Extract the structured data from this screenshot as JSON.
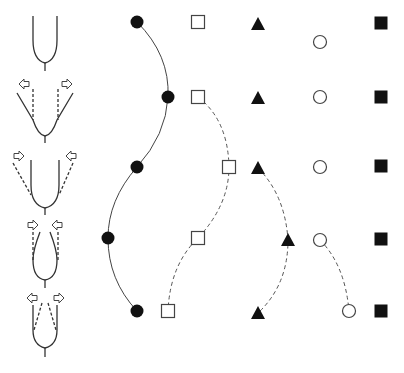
{
  "diagram": {
    "colors": {
      "stroke": "#333333",
      "fill_dark": "#111111",
      "background": "#ffffff"
    },
    "stages": [
      {
        "index": 1,
        "shape": "u-curve",
        "arrows": "none"
      },
      {
        "index": 2,
        "shape": "u-curve-widening",
        "arrows": "outward"
      },
      {
        "index": 3,
        "shape": "u-curve-narrowing",
        "arrows": "inward"
      },
      {
        "index": 4,
        "shape": "teardrop-pinched",
        "arrows": "inward"
      },
      {
        "index": 5,
        "shape": "teardrop-opening",
        "arrows": "outward"
      }
    ],
    "marker_series": [
      {
        "name": "filled-circle",
        "trajectory": "solid",
        "points": [
          [
            137,
            22
          ],
          [
            168,
            97
          ],
          [
            137,
            167
          ],
          [
            108,
            238
          ],
          [
            137,
            311
          ]
        ]
      },
      {
        "name": "open-square",
        "trajectory": "dashed",
        "points": [
          [
            198,
            22
          ],
          [
            198,
            97
          ],
          [
            229,
            167
          ],
          [
            198,
            238
          ],
          [
            168,
            311
          ]
        ]
      },
      {
        "name": "filled-triangle",
        "trajectory": "dashed",
        "points": [
          [
            258,
            24
          ],
          [
            258,
            98
          ],
          [
            258,
            168
          ],
          [
            288,
            240
          ],
          [
            258,
            313
          ]
        ]
      },
      {
        "name": "open-circle",
        "trajectory": "dashed",
        "points": [
          [
            320,
            42
          ],
          [
            320,
            97
          ],
          [
            320,
            167
          ],
          [
            320,
            240
          ],
          [
            349,
            311
          ]
        ]
      },
      {
        "name": "filled-square",
        "trajectory": "none",
        "points": [
          [
            381,
            23
          ],
          [
            381,
            97
          ],
          [
            381,
            166
          ],
          [
            381,
            239
          ],
          [
            381,
            311
          ]
        ]
      }
    ]
  }
}
